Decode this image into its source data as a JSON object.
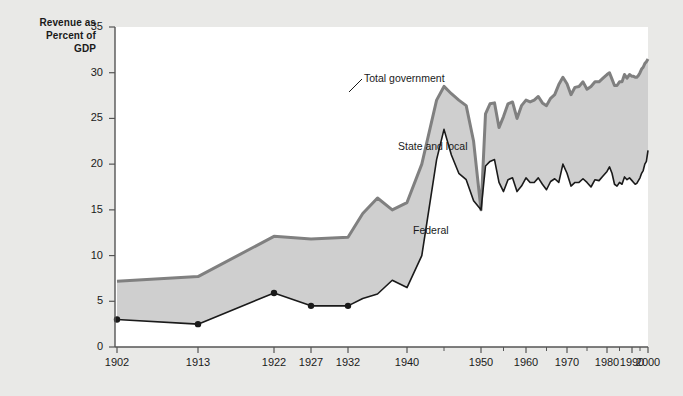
{
  "chart_data": {
    "type": "area",
    "title": "",
    "ylabel": "Revenue as Percent of GDP",
    "xlabel": "",
    "ylim": [
      0,
      35
    ],
    "yticks": [
      0,
      5,
      10,
      15,
      20,
      25,
      30,
      35
    ],
    "grid": false,
    "legend_position": "inline-annotations",
    "annotations": [
      {
        "text": "Total government",
        "target": "top-boundary-1945-peak"
      },
      {
        "text": "State and local",
        "target": "shaded-band"
      },
      {
        "text": "Federal",
        "target": "lower-area"
      }
    ],
    "xtick_labels": [
      "1902",
      "1913",
      "1922",
      "1927",
      "1932",
      "1940",
      "1950",
      "1960",
      "1970",
      "1980",
      "1990",
      "2000"
    ],
    "x": [
      1902,
      1913,
      1922,
      1927,
      1932,
      1934,
      1936,
      1938,
      1940,
      1942,
      1944,
      1945,
      1946,
      1947,
      1948,
      1949,
      1950,
      1951,
      1952,
      1953,
      1954,
      1955,
      1956,
      1957,
      1958,
      1959,
      1960,
      1961,
      1962,
      1963,
      1964,
      1965,
      1966,
      1967,
      1968,
      1969,
      1970,
      1971,
      1972,
      1973,
      1974,
      1975,
      1976,
      1977,
      1978,
      1979,
      1980,
      1981,
      1982,
      1983,
      1984,
      1985,
      1986,
      1987,
      1988,
      1989,
      1990,
      1991,
      1992,
      1993,
      1994,
      1995,
      1996,
      1997,
      1998,
      1999,
      2000
    ],
    "series": [
      {
        "name": "Total government",
        "values": [
          7.2,
          7.7,
          12.1,
          11.8,
          12.0,
          14.6,
          16.3,
          15.0,
          15.8,
          20.0,
          27.0,
          28.5,
          27.7,
          27.0,
          26.4,
          22.5,
          15.0,
          25.5,
          26.6,
          26.7,
          24.0,
          25.2,
          26.6,
          26.8,
          25.0,
          26.4,
          27.0,
          26.8,
          27.0,
          27.4,
          26.7,
          26.4,
          27.2,
          27.6,
          28.7,
          29.5,
          28.8,
          27.6,
          28.4,
          28.5,
          29.0,
          28.2,
          28.5,
          29.0,
          29.0,
          29.4,
          29.8,
          30.0,
          29.3,
          28.6,
          28.6,
          29.0,
          29.0,
          29.8,
          29.4,
          29.8,
          29.6,
          29.6,
          29.5,
          29.5,
          29.7,
          30.0,
          30.4,
          30.6,
          31.0,
          31.2,
          31.5
        ]
      },
      {
        "name": "Federal",
        "values": [
          3.0,
          2.5,
          5.9,
          4.5,
          4.5,
          5.3,
          5.8,
          7.3,
          6.5,
          10.0,
          20.5,
          23.8,
          21.0,
          19.0,
          18.3,
          16.0,
          15.0,
          19.8,
          20.3,
          20.5,
          18.0,
          17.0,
          18.3,
          18.5,
          17.0,
          17.6,
          18.5,
          18.0,
          18.0,
          18.5,
          17.8,
          17.2,
          18.1,
          18.4,
          18.0,
          20.0,
          19.0,
          17.6,
          18.0,
          18.0,
          18.4,
          18.0,
          17.5,
          18.3,
          18.2,
          18.7,
          19.2,
          19.7,
          19.0,
          17.8,
          17.6,
          18.0,
          17.8,
          18.6,
          18.3,
          18.5,
          18.2,
          18.0,
          17.8,
          17.9,
          18.2,
          18.5,
          19.0,
          19.3,
          20.0,
          20.3,
          21.5
        ]
      }
    ]
  },
  "colors": {
    "page_background": "#e9e9e7",
    "plot_background": "#ffffff",
    "band_fill": "#cfcfcf",
    "total_line": "#808080",
    "federal_line": "#1a1a1a",
    "axis": "#555555",
    "text": "#1a1a1a"
  },
  "axis_title_lines": [
    "Revenue as",
    "Percent of",
    "GDP"
  ]
}
